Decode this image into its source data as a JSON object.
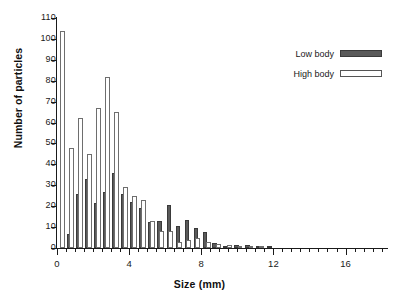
{
  "chart_data": {
    "type": "bar",
    "title": "",
    "subtitle": "",
    "xlabel": "Size (mm)",
    "ylabel": "Number of particles",
    "xlim": [
      0,
      18.3
    ],
    "ylim": [
      0,
      110
    ],
    "grid": false,
    "legend_position": "top-right",
    "x_major_ticks": [
      0,
      4,
      8,
      12,
      16
    ],
    "x_major_tick_labels": [
      "0",
      "4",
      "8",
      "12",
      "16"
    ],
    "x_minor_tick_step": 0.5,
    "y_ticks": [
      0,
      10,
      20,
      30,
      40,
      50,
      60,
      70,
      80,
      90,
      100,
      110
    ],
    "y_tick_labels": [
      "0",
      "10",
      "20",
      "30",
      "40",
      "50",
      "60",
      "70",
      "80",
      "90",
      "100",
      "110"
    ],
    "bin_width_mm": 0.25,
    "legend": [
      {
        "name": "Low body",
        "style": "filled-dark",
        "color": "#5a5a5a"
      },
      {
        "name": "High body",
        "style": "open-white",
        "color": "#ffffff"
      }
    ],
    "series": [
      {
        "name": "High body",
        "color": "#ffffff",
        "edge_color": "#6e6e6e",
        "x": [
          0.3,
          0.8,
          1.3,
          1.8,
          2.3,
          2.8,
          3.3,
          3.8,
          4.3,
          4.8,
          5.3,
          5.8,
          6.3,
          6.8,
          7.3,
          7.8,
          8.3,
          8.8,
          9.3,
          9.8,
          10.3,
          10.8,
          11.3
        ],
        "values": [
          104,
          48,
          62,
          45,
          67,
          82,
          65,
          29,
          25,
          23,
          13,
          8,
          8,
          3,
          4,
          5,
          3,
          2,
          1,
          1.5,
          1,
          1,
          1
        ]
      },
      {
        "name": "Low body",
        "color": "#5a5a5a",
        "edge_color": "#3a3a3a",
        "x": [
          0.7,
          1.2,
          1.7,
          2.2,
          2.7,
          3.2,
          3.7,
          4.2,
          4.7,
          5.2,
          5.7,
          6.2,
          6.7,
          7.2,
          7.7,
          8.2,
          8.7,
          9.2,
          9.7,
          10.2,
          10.7
        ],
        "values": [
          6.5,
          26,
          33,
          21.5,
          27,
          36,
          26,
          22,
          19,
          12.5,
          13,
          20.5,
          10.5,
          13.5,
          9.5,
          7.5,
          2.5,
          1,
          1,
          1,
          0.5
        ]
      }
    ],
    "bars": [
      {
        "series": "High body",
        "x": 0.3,
        "value": 104
      },
      {
        "series": "Low body",
        "x": 0.7,
        "value": 6.5
      },
      {
        "series": "High body",
        "x": 0.8,
        "value": 48
      },
      {
        "series": "Low body",
        "x": 1.2,
        "value": 26
      },
      {
        "series": "High body",
        "x": 1.3,
        "value": 62
      },
      {
        "series": "Low body",
        "x": 1.7,
        "value": 33
      },
      {
        "series": "High body",
        "x": 1.8,
        "value": 45
      },
      {
        "series": "Low body",
        "x": 2.2,
        "value": 21.5
      },
      {
        "series": "High body",
        "x": 2.3,
        "value": 67
      },
      {
        "series": "Low body",
        "x": 2.7,
        "value": 27
      },
      {
        "series": "High body",
        "x": 2.8,
        "value": 82
      },
      {
        "series": "Low body",
        "x": 3.2,
        "value": 36
      },
      {
        "series": "High body",
        "x": 3.3,
        "value": 65
      },
      {
        "series": "Low body",
        "x": 3.7,
        "value": 26
      },
      {
        "series": "High body",
        "x": 3.8,
        "value": 29
      },
      {
        "series": "Low body",
        "x": 4.2,
        "value": 22
      },
      {
        "series": "High body",
        "x": 4.3,
        "value": 25
      },
      {
        "series": "Low body",
        "x": 4.7,
        "value": 19
      },
      {
        "series": "High body",
        "x": 4.8,
        "value": 23
      },
      {
        "series": "Low body",
        "x": 5.2,
        "value": 12.5
      },
      {
        "series": "High body",
        "x": 5.3,
        "value": 13
      },
      {
        "series": "Low body",
        "x": 5.7,
        "value": 13
      },
      {
        "series": "High body",
        "x": 5.8,
        "value": 8
      },
      {
        "series": "Low body",
        "x": 6.2,
        "value": 20.5
      },
      {
        "series": "High body",
        "x": 6.3,
        "value": 8
      },
      {
        "series": "Low body",
        "x": 6.7,
        "value": 10.5
      },
      {
        "series": "High body",
        "x": 6.8,
        "value": 3
      },
      {
        "series": "Low body",
        "x": 7.2,
        "value": 13.5
      },
      {
        "series": "High body",
        "x": 7.3,
        "value": 4
      },
      {
        "series": "Low body",
        "x": 7.7,
        "value": 9.5
      },
      {
        "series": "High body",
        "x": 7.8,
        "value": 5
      },
      {
        "series": "Low body",
        "x": 8.2,
        "value": 7.5
      },
      {
        "series": "High body",
        "x": 8.4,
        "value": 3
      },
      {
        "series": "Low body",
        "x": 8.75,
        "value": 2.5
      },
      {
        "series": "High body",
        "x": 8.95,
        "value": 2
      },
      {
        "series": "Low body",
        "x": 9.35,
        "value": 1
      },
      {
        "series": "High body",
        "x": 9.55,
        "value": 1.5
      },
      {
        "series": "Low body",
        "x": 9.95,
        "value": 1.5
      },
      {
        "series": "High body",
        "x": 10.15,
        "value": 1
      },
      {
        "series": "Low body",
        "x": 10.55,
        "value": 1.5
      },
      {
        "series": "High body",
        "x": 10.75,
        "value": 1
      },
      {
        "series": "Low body",
        "x": 11.15,
        "value": 1
      },
      {
        "series": "High body",
        "x": 11.35,
        "value": 1
      },
      {
        "series": "Low body",
        "x": 11.8,
        "value": 0.8
      }
    ]
  },
  "axis": {
    "x_title": "Size (mm)",
    "y_title": "Number of particles"
  }
}
